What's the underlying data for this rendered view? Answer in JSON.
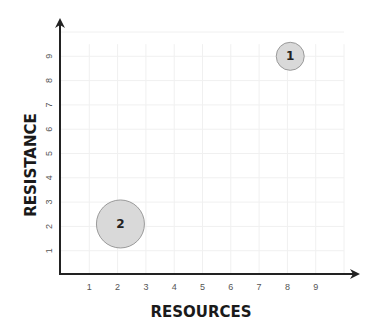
{
  "chart_data": {
    "type": "scatter",
    "title": "",
    "xlabel": "RESOURCES",
    "ylabel": "RESISTANCE",
    "xlim": [
      0,
      10
    ],
    "ylim": [
      0,
      10
    ],
    "x_ticks": [
      "1",
      "2",
      "3",
      "4",
      "5",
      "6",
      "7",
      "8",
      "9"
    ],
    "y_ticks": [
      "1",
      "2",
      "3",
      "4",
      "5",
      "6",
      "7",
      "8",
      "9"
    ],
    "grid": true,
    "points": [
      {
        "label": "1",
        "x": 8.1,
        "y": 9.0,
        "size": "small",
        "color": "#d9d9d9"
      },
      {
        "label": "2",
        "x": 2.1,
        "y": 2.1,
        "size": "large",
        "color": "#d9d9d9"
      }
    ]
  }
}
